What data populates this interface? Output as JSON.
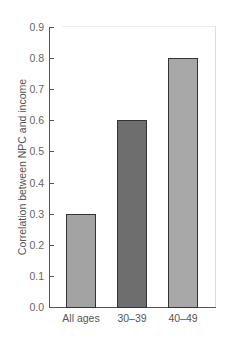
{
  "chart_data": {
    "type": "bar",
    "title": "",
    "xlabel": "",
    "ylabel": "Correlation between NPC and income",
    "categories": [
      "All ages",
      "30–39",
      "40–49"
    ],
    "values": [
      0.3,
      0.6,
      0.8
    ],
    "colors": [
      "#a3a3a3",
      "#6e6e6e",
      "#a8a8a8"
    ],
    "ylim": [
      0.0,
      0.9
    ],
    "yticks": [
      "0.0",
      "0.1",
      "0.2",
      "0.3",
      "0.4",
      "0.5",
      "0.6",
      "0.7",
      "0.8",
      "0.9"
    ],
    "grid": false,
    "legend": null
  }
}
